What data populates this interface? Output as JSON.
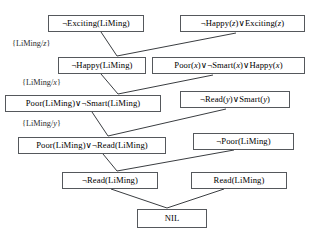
{
  "diagram": {
    "type": "resolution-proof-tree",
    "colors": {
      "background": "#ffffff",
      "box_border": "#55585c",
      "edge": "#3a3d41",
      "text": "#000000"
    },
    "nodes": [
      {
        "id": "n1",
        "name": "not-exciting-liming",
        "text": "¬Exciting(LiMing)",
        "x": 48,
        "y": 15,
        "w": 96,
        "h": 17,
        "font_size": 8.6
      },
      {
        "id": "n2",
        "name": "not-happy-z-or-exciting-z",
        "text": "¬Happy(z)∨Exciting(z)",
        "x": 180,
        "y": 15,
        "w": 125,
        "h": 17,
        "font_size": 8.6
      },
      {
        "id": "n3",
        "name": "not-happy-liming",
        "text": "¬Happy(LiMing)",
        "x": 58,
        "y": 57,
        "w": 88,
        "h": 17,
        "font_size": 8.6
      },
      {
        "id": "n4",
        "name": "poor-x-or-not-smart-x-or-happy-x",
        "text": "Poor(x)∨¬Smart(x)∨Happy(x)",
        "x": 152,
        "y": 57,
        "w": 153,
        "h": 17,
        "font_size": 8.6
      },
      {
        "id": "n5",
        "name": "poor-liming-or-not-smart-liming",
        "text": "Poor(LiMing)∨¬Smart(LiMing)",
        "x": 5,
        "y": 95,
        "w": 156,
        "h": 17,
        "font_size": 8.6
      },
      {
        "id": "n6",
        "name": "not-read-y-or-smart-y",
        "text": "¬Read(y)∨Smart(y)",
        "x": 180,
        "y": 91,
        "w": 110,
        "h": 17,
        "font_size": 8.6
      },
      {
        "id": "n7",
        "name": "poor-liming-or-not-read-liming",
        "text": "Poor(LiMing)∨¬Read(LiMing)",
        "x": 18,
        "y": 137,
        "w": 148,
        "h": 17,
        "font_size": 8.6
      },
      {
        "id": "n8",
        "name": "not-poor-liming",
        "text": "¬Poor(LiMing)",
        "x": 193,
        "y": 133,
        "w": 101,
        "h": 17,
        "font_size": 8.6
      },
      {
        "id": "n9",
        "name": "not-read-liming",
        "text": "¬Read(LiMing)",
        "x": 62,
        "y": 172,
        "w": 96,
        "h": 17,
        "font_size": 8.6
      },
      {
        "id": "n10",
        "name": "read-liming",
        "text": "Read(LiMing)",
        "x": 191,
        "y": 172,
        "w": 96,
        "h": 17,
        "font_size": 8.6
      },
      {
        "id": "n11",
        "name": "nil-empty-clause",
        "text": "NIL",
        "x": 137,
        "y": 209,
        "w": 70,
        "h": 19,
        "font_size": 8.6
      }
    ],
    "substitutions": [
      {
        "id": "s1",
        "name": "substitution-liming-z",
        "text": "{LiMing/z}",
        "x": 12,
        "y": 40,
        "font_size": 8.2
      },
      {
        "id": "s2",
        "name": "substitution-liming-x",
        "text": "{LiMing/x}",
        "x": 22,
        "y": 79,
        "font_size": 8.2
      },
      {
        "id": "s3",
        "name": "substitution-liming-y",
        "text": "{LiMing/y}",
        "x": 22,
        "y": 120,
        "font_size": 8.2
      }
    ],
    "edges": [
      {
        "name": "edge-not-exciting-to-not-happy",
        "from": "n1",
        "to": "n3",
        "x1": 101,
        "y1": 32,
        "x2": 117,
        "y2": 56
      },
      {
        "name": "edge-not-happy-z-to-not-happy",
        "from": "n2",
        "to": "n3",
        "x1": 236,
        "y1": 33,
        "x2": 117,
        "y2": 56
      },
      {
        "name": "edge-not-happy-to-poor-smart",
        "from": "n3",
        "to": "n5",
        "x1": 101,
        "y1": 74,
        "x2": 118,
        "y2": 94
      },
      {
        "name": "edge-poor-x-to-poor-smart",
        "from": "n4",
        "to": "n5",
        "x1": 213,
        "y1": 75,
        "x2": 118,
        "y2": 94
      },
      {
        "name": "edge-poor-smart-to-poor-read",
        "from": "n5",
        "to": "n7",
        "x1": 92,
        "y1": 112,
        "x2": 108,
        "y2": 136
      },
      {
        "name": "edge-not-read-y-to-poor-read",
        "from": "n6",
        "to": "n7",
        "x1": 226,
        "y1": 109,
        "x2": 108,
        "y2": 136
      },
      {
        "name": "edge-poor-read-to-not-read",
        "from": "n7",
        "to": "n9",
        "x1": 103,
        "y1": 154,
        "x2": 117,
        "y2": 171
      },
      {
        "name": "edge-not-poor-to-not-read",
        "from": "n8",
        "to": "n9",
        "x1": 234,
        "y1": 150,
        "x2": 117,
        "y2": 171
      },
      {
        "name": "edge-not-read-to-nil",
        "from": "n9",
        "to": "n11",
        "x1": 111,
        "y1": 189,
        "x2": 167,
        "y2": 208
      },
      {
        "name": "edge-read-to-nil",
        "from": "n10",
        "to": "n11",
        "x1": 224,
        "y1": 189,
        "x2": 167,
        "y2": 208
      }
    ]
  }
}
